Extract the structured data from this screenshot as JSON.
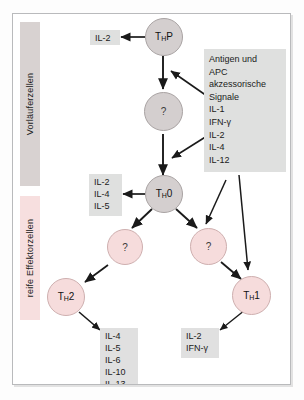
{
  "diagram": {
    "sidebars": [
      {
        "name": "vorlaeuferzellen",
        "label": "Vorläuferzellen",
        "color": "#d8d2d1"
      },
      {
        "name": "effektorzellen",
        "label": "reife Effektorzellen",
        "color": "#f7dfdf"
      }
    ],
    "cells": [
      {
        "id": "thp",
        "label": "T",
        "sub": "H",
        "suffix": "P",
        "color": "gray"
      },
      {
        "id": "q1",
        "label": "?",
        "color": "gray"
      },
      {
        "id": "th0",
        "label": "T",
        "sub": "H",
        "suffix": "0",
        "color": "gray"
      },
      {
        "id": "q2",
        "label": "?",
        "color": "pink"
      },
      {
        "id": "q3",
        "label": "?",
        "color": "pink"
      },
      {
        "id": "th2",
        "label": "T",
        "sub": "H",
        "suffix": "2",
        "color": "pink"
      },
      {
        "id": "th1",
        "label": "T",
        "sub": "H",
        "suffix": "1",
        "color": "pink"
      }
    ],
    "chips": {
      "thp_output": "IL-2",
      "th0_output": "IL-2\nIL-4\nIL-5",
      "th2_output": "IL-4\nIL-5\nIL-6\nIL-10\nIL-13",
      "th1_output": "IL-2\nIFN-γ"
    },
    "stimulus_box": {
      "name": "antigen-apc-signale",
      "text": "Antigen und\nAPC\nakzessorische\nSignale\nIL-1\nIFN-γ\nIL-2\nIL-4\nIL-12",
      "items": [
        "Antigen und",
        "APC",
        "akzessorische",
        "Signale",
        "IL-1",
        "IFN-γ",
        "IL-2",
        "IL-4",
        "IL-12"
      ],
      "color": "#dfe0df"
    },
    "colors": {
      "precursor_bar": "#d8d2d1",
      "effector_bar": "#f7dfdf",
      "precursor_cell": "#d4cfcf",
      "effector_cell": "#f6dcdc",
      "chip": "#dfe0df",
      "arrow": "#1a1a1a",
      "frame_border": "#b9babc"
    }
  }
}
